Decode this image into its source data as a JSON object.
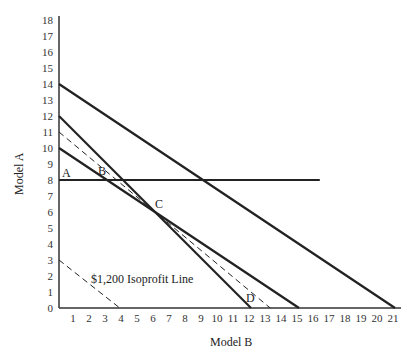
{
  "chart_data": {
    "type": "line",
    "title": "",
    "xlabel": "Model B",
    "ylabel": "Model A",
    "xlim": [
      0,
      21
    ],
    "ylim": [
      0,
      18
    ],
    "x_ticks": [
      1,
      2,
      3,
      4,
      5,
      6,
      7,
      8,
      9,
      10,
      11,
      12,
      13,
      14,
      15,
      16,
      17,
      18,
      19,
      20,
      21
    ],
    "y_ticks": [
      0,
      1,
      2,
      3,
      4,
      5,
      6,
      7,
      8,
      9,
      10,
      11,
      12,
      13,
      14,
      15,
      16,
      17,
      18
    ],
    "grid": false,
    "series": [
      {
        "name": "Constraint 1",
        "style": "solid",
        "points": [
          [
            0,
            14
          ],
          [
            21,
            0
          ]
        ]
      },
      {
        "name": "Constraint 2",
        "style": "solid",
        "points": [
          [
            0,
            12
          ],
          [
            12,
            0
          ]
        ]
      },
      {
        "name": "Constraint 3",
        "style": "solid",
        "points": [
          [
            0,
            10
          ],
          [
            15,
            0
          ]
        ]
      },
      {
        "name": "Constraint 4 (Model A >= 8)",
        "style": "solid",
        "points": [
          [
            0,
            8
          ],
          [
            16.3,
            8
          ]
        ]
      },
      {
        "name": "Optimal isoprofit",
        "style": "dashed",
        "points": [
          [
            0,
            11
          ],
          [
            13.2,
            0
          ]
        ]
      },
      {
        "name": "$1,200 Isoprofit Line",
        "style": "dashed",
        "points": [
          [
            0,
            3
          ],
          [
            3.8,
            0
          ]
        ]
      }
    ],
    "annotations": [
      {
        "text": "A",
        "x": 0.3,
        "y": 8.3
      },
      {
        "text": "B",
        "x": 2.6,
        "y": 8.4
      },
      {
        "text": "C",
        "x": 6.3,
        "y": 6.1
      },
      {
        "text": "D",
        "x": 11.9,
        "y": 0.4
      },
      {
        "text": "$1,200 Isoprofit Line",
        "x": 4.3,
        "y": 1.7
      }
    ]
  },
  "labels": {
    "xlabel": "Model B",
    "ylabel": "Model A",
    "point_a": "A",
    "point_b": "B",
    "point_c": "C",
    "point_d": "D",
    "isoprofit": "$1,200 Isoprofit Line"
  }
}
